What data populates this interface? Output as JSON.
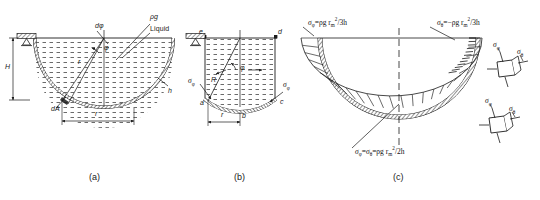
{
  "figure": {
    "type": "engineering-diagram",
    "panels": [
      {
        "id": "a",
        "caption": "(a)",
        "labels": [
          {
            "name": "dphi",
            "text": "dφ"
          },
          {
            "name": "rho-g",
            "text": "ρg"
          },
          {
            "name": "liquid",
            "text": "Liquid"
          },
          {
            "name": "height-H",
            "text": "H"
          },
          {
            "name": "radius-r-inner",
            "text": "r"
          },
          {
            "name": "phi-angle",
            "text": "φ"
          },
          {
            "name": "dA-element",
            "text": "dA"
          },
          {
            "name": "radius-r-dim",
            "text": "r"
          },
          {
            "name": "thickness-h",
            "text": "h"
          }
        ]
      },
      {
        "id": "b",
        "caption": "(b)",
        "labels": [
          {
            "name": "point-e",
            "text": "e"
          },
          {
            "name": "point-d",
            "text": "d"
          },
          {
            "name": "radius-R",
            "text": "R"
          },
          {
            "name": "phi-angle",
            "text": "φ"
          },
          {
            "name": "point-a",
            "text": "a"
          },
          {
            "name": "point-b",
            "text": "b"
          },
          {
            "name": "point-c",
            "text": "c"
          },
          {
            "name": "radius-r-dim",
            "text": "r"
          },
          {
            "name": "sigma-phi-left",
            "text": "σφ"
          },
          {
            "name": "sigma-phi-right",
            "text": "σφ"
          }
        ]
      },
      {
        "id": "c",
        "caption": "(c)",
        "formulas": [
          {
            "name": "sigma-phi-top-left",
            "sigma": "σ",
            "sub": "φ",
            "eq": "=",
            "expr": "ρg r",
            "exp": "2",
            "expsub": "m",
            "denom": "/3h",
            "full": "σφ = ρg rₘ²/3h"
          },
          {
            "name": "sigma-theta-top-right",
            "sigma": "σ",
            "sub": "θ",
            "eq": "=",
            "expr": "−ρg r",
            "exp": "2",
            "expsub": "m",
            "denom": "/3h",
            "full": "σθ = −ρg rₘ²/3h"
          },
          {
            "name": "sigma-bottom",
            "full": "σφ = σθ = ρg rₘ²/2h"
          }
        ],
        "stress_elements": [
          {
            "name": "stress-element-upper",
            "labels": [
              "σφ",
              "σθ"
            ]
          },
          {
            "name": "stress-element-lower",
            "labels": [
              "σφ",
              "σθ"
            ]
          }
        ]
      }
    ]
  },
  "text": {
    "dphi": "dφ",
    "rho_g": "ρg",
    "liquid": "Liquid",
    "H": "H",
    "r": "r",
    "phi": "φ",
    "dA": "dA",
    "h": "h",
    "R": "R",
    "a": "a",
    "b": "b",
    "c": "c",
    "d": "d",
    "e": "e",
    "sigma_phi": "σ",
    "sub_phi": "φ",
    "sub_theta": "θ",
    "cap_a": "(a)",
    "cap_b": "(b)",
    "cap_c": "(c)"
  },
  "formulas": {
    "top_left_sigma": "σ",
    "top_left_sub": "φ",
    "top_left_rest": "=ρg r",
    "top_left_sup": "2",
    "top_left_supsub": "m",
    "top_left_tail": "/3h",
    "top_right_sigma": "σ",
    "top_right_sub": "θ",
    "top_right_rest": "=−ρg r",
    "top_right_sup": "2",
    "top_right_supsub": "m",
    "top_right_tail": "/3h",
    "bottom_sigma1": "σ",
    "bottom_sub1": "φ",
    "bottom_mid": "=",
    "bottom_sigma2": "σ",
    "bottom_sub2": "θ",
    "bottom_rest": "=ρg r",
    "bottom_sup": "2",
    "bottom_supsub": "m",
    "bottom_tail": "/2h"
  },
  "colors": {
    "ink": "#1a1a1a",
    "paper": "#ffffff",
    "liquid_dash": "#333333",
    "shell_fill": "#555555"
  }
}
